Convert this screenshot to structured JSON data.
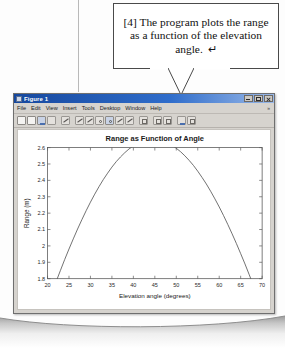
{
  "callout": {
    "text": "[4] The program plots the range as a function of the elevation angle.",
    "return_symbol": "↵"
  },
  "window": {
    "title": "Figure 1",
    "controls": {
      "minimize": "Minimize",
      "maximize": "Maximize",
      "close": "Close"
    },
    "menus": [
      {
        "label": "File"
      },
      {
        "label": "Edit"
      },
      {
        "label": "View"
      },
      {
        "label": "Insert"
      },
      {
        "label": "Tools"
      },
      {
        "label": "Desktop"
      },
      {
        "label": "Window"
      },
      {
        "label": "Help"
      }
    ],
    "menu_overflow": "»",
    "toolbar": [
      {
        "name": "new-figure-icon"
      },
      {
        "name": "open-file-icon"
      },
      {
        "name": "save-figure-icon"
      },
      {
        "name": "print-figure-icon"
      },
      {
        "name": "edit-plot-icon"
      },
      {
        "name": "zoom-in-icon"
      },
      {
        "name": "zoom-out-icon"
      },
      {
        "name": "pan-icon"
      },
      {
        "name": "rotate-3d-icon"
      },
      {
        "name": "data-cursor-icon"
      },
      {
        "name": "brush-icon"
      },
      {
        "name": "insert-colorbar-icon"
      },
      {
        "name": "insert-legend-icon"
      },
      {
        "name": "hide-plot-tools-icon"
      },
      {
        "name": "show-plot-tools-icon"
      }
    ]
  },
  "chart_data": {
    "type": "line",
    "title": "Range as Function of Angle",
    "xlabel": "Elevation angle (degrees)",
    "ylabel": "Range (m)",
    "xlim": [
      20,
      70
    ],
    "ylim": [
      1.8,
      2.6
    ],
    "xticks": [
      20,
      25,
      30,
      35,
      40,
      45,
      50,
      55,
      60,
      65,
      70
    ],
    "yticks": [
      1.8,
      1.9,
      2,
      2.1,
      2.2,
      2.3,
      2.4,
      2.5,
      2.6
    ],
    "xtick_labels": [
      "20",
      "25",
      "30",
      "35",
      "40",
      "45",
      "50",
      "55",
      "60",
      "65",
      "70"
    ],
    "ytick_labels": [
      "1.8",
      "1.9",
      "2",
      "2.1",
      "2.2",
      "2.3",
      "2.4",
      "2.5",
      "2.6"
    ],
    "grid": false,
    "legend": null,
    "line_color": "#4a4a4a",
    "series": [
      {
        "name": "Range",
        "x": [
          20,
          21,
          22,
          23,
          24,
          25,
          26,
          27,
          28,
          29,
          30,
          31,
          32,
          33,
          34,
          35,
          36,
          37,
          38,
          39,
          40,
          41,
          42,
          43,
          44,
          45,
          46,
          47,
          48,
          49,
          50,
          51,
          52,
          53,
          54,
          55,
          56,
          57,
          58,
          59,
          60,
          61,
          62,
          63,
          64,
          65,
          66,
          67,
          68,
          69,
          70
        ],
        "values": [
          1.641,
          1.712,
          1.782,
          1.85,
          1.917,
          1.981,
          2.043,
          2.103,
          2.16,
          2.215,
          2.267,
          2.316,
          2.362,
          2.405,
          2.444,
          2.481,
          2.514,
          2.543,
          2.569,
          2.592,
          2.61,
          2.625,
          2.637,
          2.644,
          2.648,
          2.649,
          2.645,
          2.638,
          2.628,
          2.614,
          2.596,
          2.575,
          2.55,
          2.522,
          2.491,
          2.456,
          2.418,
          2.378,
          2.334,
          2.287,
          2.238,
          2.186,
          2.131,
          2.074,
          2.015,
          1.953,
          1.89,
          1.824,
          1.757,
          1.688,
          1.617
        ]
      }
    ]
  }
}
